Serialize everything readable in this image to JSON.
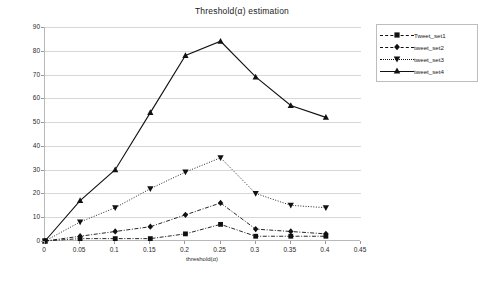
{
  "chart_data": {
    "type": "line",
    "title": "Threshold(α) estimation",
    "xlabel": "threshold(α)",
    "ylabel": "No of homogeneous event bearing clusters",
    "xlim": [
      0,
      0.45
    ],
    "ylim": [
      0,
      90
    ],
    "xticks": [
      "0",
      "0.05",
      "0.1",
      "0.15",
      "0.2",
      "0.25",
      "0.3",
      "0.35",
      "0.4",
      "0.45"
    ],
    "yticks": [
      "0",
      "10",
      "20",
      "30",
      "40",
      "50",
      "60",
      "70",
      "80",
      "90"
    ],
    "grid": true,
    "legend_position": "top-right",
    "x": [
      0,
      0.05,
      0.1,
      0.15,
      0.2,
      0.25,
      0.3,
      0.35,
      0.4
    ],
    "series": [
      {
        "name": "Tweet_set1",
        "marker": "square",
        "linestyle": "dash-dot",
        "values": [
          0,
          1,
          1,
          1,
          3,
          7,
          2,
          2,
          2
        ]
      },
      {
        "name": "tweet_set2",
        "marker": "diamond",
        "linestyle": "dash-dot",
        "values": [
          0,
          2,
          4,
          6,
          11,
          16,
          5,
          4,
          3
        ]
      },
      {
        "name": "tweet_set3",
        "marker": "triangle-down",
        "linestyle": "dotted",
        "values": [
          0,
          8,
          14,
          22,
          29,
          35,
          20,
          15,
          14
        ]
      },
      {
        "name": "tweet_set4",
        "marker": "triangle-up",
        "linestyle": "solid",
        "values": [
          0,
          17,
          30,
          54,
          78,
          84,
          69,
          57,
          52
        ]
      }
    ]
  },
  "legend": {
    "items": [
      {
        "label": "Tweet_set1"
      },
      {
        "label": "tweet_set2"
      },
      {
        "label": "tweet_set3"
      },
      {
        "label": "tweet_set4"
      }
    ]
  }
}
